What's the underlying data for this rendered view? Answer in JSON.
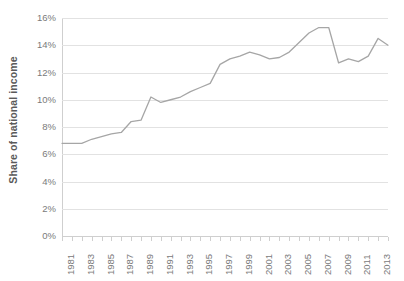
{
  "chart_data": {
    "type": "line",
    "title": "",
    "subtitle": "",
    "xlabel": "",
    "ylabel": "Share of national income",
    "ylim": [
      0,
      16
    ],
    "ytick_labels": [
      "0%",
      "2%",
      "4%",
      "6%",
      "8%",
      "10%",
      "12%",
      "14%",
      "16%"
    ],
    "ytick_values": [
      0,
      2,
      4,
      6,
      8,
      10,
      12,
      14,
      16
    ],
    "xlim": [
      1981,
      2014
    ],
    "xtick_labels": [
      "1981",
      "1983",
      "1985",
      "1987",
      "1989",
      "1991",
      "1993",
      "1995",
      "1997",
      "1999",
      "2001",
      "2003",
      "2005",
      "2007",
      "2009",
      "2011",
      "2013"
    ],
    "xtick_values": [
      1981,
      1983,
      1985,
      1987,
      1989,
      1991,
      1993,
      1995,
      1997,
      1999,
      2001,
      2003,
      2005,
      2007,
      2009,
      2011,
      2013
    ],
    "grid": "horizontal",
    "legend": "none",
    "series_color": "#a6a6a6",
    "gridline_color": "#e2e2e2",
    "axis_color": "#cfcfcf",
    "label_color": "#7a7a7a",
    "x": [
      1981,
      1982,
      1983,
      1984,
      1985,
      1986,
      1987,
      1988,
      1989,
      1990,
      1991,
      1992,
      1993,
      1994,
      1995,
      1996,
      1997,
      1998,
      1999,
      2000,
      2001,
      2002,
      2003,
      2004,
      2005,
      2006,
      2007,
      2008,
      2009,
      2010,
      2011,
      2012,
      2013,
      2014
    ],
    "values": [
      6.8,
      6.8,
      6.8,
      7.1,
      7.3,
      7.5,
      7.6,
      8.4,
      8.5,
      10.2,
      9.8,
      10.0,
      10.2,
      10.6,
      10.9,
      11.2,
      12.6,
      13.0,
      13.2,
      13.5,
      13.3,
      13.0,
      13.1,
      13.5,
      14.2,
      14.9,
      15.3,
      15.3,
      12.7,
      13.0,
      12.8,
      13.2,
      14.5,
      14.0
    ],
    "series": [
      {
        "name": "Share of national income",
        "values": [
          6.8,
          6.8,
          6.8,
          7.1,
          7.3,
          7.5,
          7.6,
          8.4,
          8.5,
          10.2,
          9.8,
          10.0,
          10.2,
          10.6,
          10.9,
          11.2,
          12.6,
          13.0,
          13.2,
          13.5,
          13.3,
          13.0,
          13.1,
          13.5,
          14.2,
          14.9,
          15.3,
          15.3,
          12.7,
          13.0,
          12.8,
          13.2,
          14.5,
          14.0
        ]
      }
    ]
  }
}
